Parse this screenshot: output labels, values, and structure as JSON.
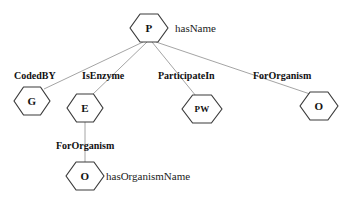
{
  "diagram": {
    "background_color": "#ffffff",
    "node_stroke_color": "#3b3b3b",
    "edge_stroke_color": "#9a9a9a",
    "text_color": "#111111",
    "nodes": [
      {
        "id": "P",
        "label": "P",
        "cx": 149,
        "cy": 28,
        "rx": 19,
        "ry": 14,
        "font_size": 11
      },
      {
        "id": "G",
        "label": "G",
        "cx": 32,
        "cy": 101,
        "rx": 18,
        "ry": 14,
        "font_size": 11
      },
      {
        "id": "E",
        "label": "E",
        "cx": 85,
        "cy": 108,
        "rx": 18,
        "ry": 14,
        "font_size": 11
      },
      {
        "id": "PW",
        "label": "PW",
        "cx": 202,
        "cy": 109,
        "rx": 20,
        "ry": 14,
        "font_size": 9
      },
      {
        "id": "O1",
        "label": "O",
        "cx": 319,
        "cy": 106,
        "rx": 19,
        "ry": 14,
        "font_size": 11
      },
      {
        "id": "O2",
        "label": "O",
        "cx": 85,
        "cy": 176,
        "rx": 19,
        "ry": 14,
        "font_size": 11
      }
    ],
    "edges": [
      {
        "from": "P",
        "to": "G",
        "label": "CodedBY",
        "x1": 143,
        "y1": 42,
        "x2": 44,
        "y2": 89
      },
      {
        "from": "P",
        "to": "E",
        "label": "IsEnzyme",
        "x1": 147,
        "y1": 42,
        "x2": 92,
        "y2": 95
      },
      {
        "from": "P",
        "to": "PW",
        "label": "ParticipateIn",
        "x1": 152,
        "y1": 42,
        "x2": 196,
        "y2": 96
      },
      {
        "from": "P",
        "to": "O1",
        "label": "ForOrganism",
        "x1": 156,
        "y1": 42,
        "x2": 310,
        "y2": 94
      },
      {
        "from": "E",
        "to": "O2",
        "label": "ForOrganism",
        "x1": 85,
        "y1": 122,
        "x2": 85,
        "y2": 163
      }
    ],
    "edge_labels": [
      {
        "text": "CodedBY",
        "x": 14,
        "y": 71,
        "font_size": 10
      },
      {
        "text": "IsEnzyme",
        "x": 82,
        "y": 71,
        "font_size": 10
      },
      {
        "text": "ParticipateIn",
        "x": 158,
        "y": 71,
        "font_size": 10
      },
      {
        "text": "ForOrganism",
        "x": 253,
        "y": 71,
        "font_size": 10
      },
      {
        "text": "ForOrganism",
        "x": 56,
        "y": 141,
        "font_size": 10
      }
    ],
    "attributes": [
      {
        "text": "hasName",
        "x": 175,
        "y": 23,
        "font_size": 11
      },
      {
        "text": "hasOrganismName",
        "x": 106,
        "y": 171,
        "font_size": 11
      }
    ]
  }
}
